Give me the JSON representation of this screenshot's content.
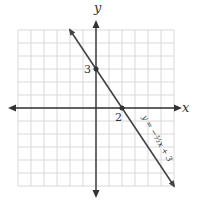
{
  "chart_data": {
    "type": "line",
    "title": "",
    "xlabel": "x",
    "ylabel": "y",
    "xlim": [
      -6,
      6
    ],
    "ylim": [
      -6,
      6
    ],
    "grid": true,
    "series": [
      {
        "name": "y = -3/2 x + 3",
        "equation": "y = -(3/2)x + 3",
        "slope": -1.5,
        "intercept": 3,
        "x": [
          -2,
          6
        ],
        "y": [
          6,
          -6
        ]
      }
    ],
    "points": [
      {
        "x": 0,
        "y": 3,
        "label": "3"
      },
      {
        "x": 2,
        "y": 0,
        "label": "2"
      }
    ],
    "annotation": "y = −³⁄₂x + 3",
    "colors": {
      "grid": "#d9d9d9",
      "axis": "#333333",
      "line": "#444444"
    }
  }
}
